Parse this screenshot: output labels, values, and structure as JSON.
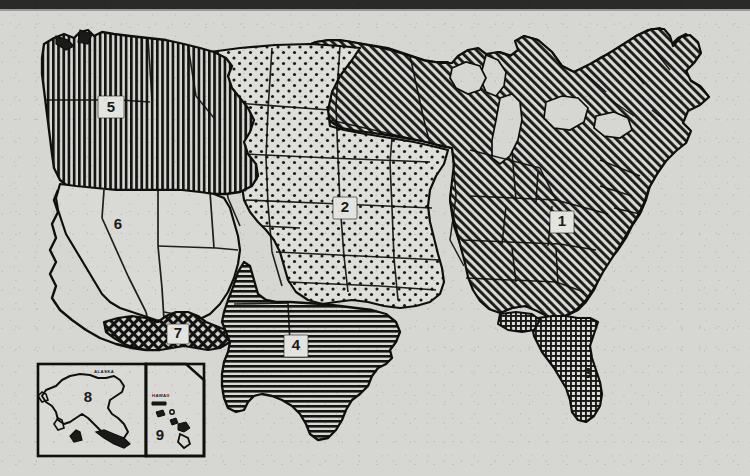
{
  "figure": {
    "type": "choropleth-region-map",
    "background_color": "#d6d6d2",
    "ink_color": "#1a1a18",
    "top_rule_color": "#2a2a28"
  },
  "regions": [
    {
      "id": "1",
      "label": "1",
      "pattern": "diagonal-hatch",
      "label_x": 562,
      "label_y": 222,
      "area": "Northeast, Midwest and Southeast"
    },
    {
      "id": "2",
      "label": "2",
      "pattern": "dots",
      "label_x": 345,
      "label_y": 208,
      "area": "Great Plains and Central"
    },
    {
      "id": "3",
      "label": "3",
      "pattern": "fine-crosshatch",
      "label_x": 588,
      "label_y": 374,
      "area": "Florida"
    },
    {
      "id": "4",
      "label": "4",
      "pattern": "horizontal-hatch",
      "label_x": 296,
      "label_y": 346,
      "area": "Texas"
    },
    {
      "id": "5",
      "label": "5",
      "pattern": "vertical-hatch",
      "label_x": 111,
      "label_y": 107,
      "area": "Pacific Northwest"
    },
    {
      "id": "6",
      "label": "6",
      "pattern": "plain",
      "label_x": 118,
      "label_y": 225,
      "area": "Southwest and California"
    },
    {
      "id": "7",
      "label": "7",
      "pattern": "net-crosshatch",
      "label_x": 178,
      "label_y": 334,
      "area": "Southern border strip"
    },
    {
      "id": "8",
      "label": "8",
      "pattern": "plain",
      "label_x": 88,
      "label_y": 398,
      "area": "Alaska"
    },
    {
      "id": "9",
      "label": "9",
      "pattern": "plain",
      "label_x": 160,
      "label_y": 436,
      "area": "Hawaii"
    }
  ],
  "insets": [
    {
      "name": "alaska-inset",
      "title": "ALASKA",
      "title_x": 106,
      "title_y": 371,
      "region_id": "8"
    },
    {
      "name": "hawaii-inset",
      "title": "HAWAII",
      "title_x": 143,
      "title_y": 399,
      "region_id": "9"
    }
  ],
  "legend_numbers": [
    "1",
    "2",
    "3",
    "4",
    "5",
    "6",
    "7",
    "8",
    "9"
  ]
}
